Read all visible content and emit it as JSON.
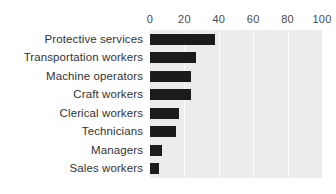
{
  "chart_data": {
    "type": "bar",
    "orientation": "horizontal",
    "title": "",
    "subtitle": "",
    "xlabel": "",
    "ylabel": "",
    "categories": [
      "Protective services",
      "Transportation workers",
      "Machine operators",
      "Craft workers",
      "Clerical workers",
      "Technicians",
      "Managers",
      "Sales workers"
    ],
    "values": [
      38,
      27,
      24,
      24,
      17,
      15,
      7,
      5
    ],
    "xlim": [
      0,
      100
    ],
    "ticks": [
      0,
      20,
      40,
      60,
      80,
      100
    ],
    "tick_labels": [
      "0",
      "20",
      "40",
      "60",
      "80",
      "100"
    ],
    "grid": true,
    "grid_orientation": "vertical",
    "legend": false,
    "legend_position": "none",
    "axis_position": "top",
    "bar_color": "#1b1b1b",
    "plot_background": "#ececec",
    "gridline_color": "#fbfbfb",
    "page_background": "#ffffff",
    "label_color": "#333333"
  }
}
